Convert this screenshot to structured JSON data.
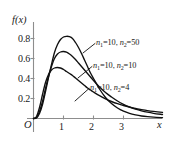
{
  "chart_data": {
    "type": "line",
    "title": "",
    "xlabel": "x",
    "ylabel": "f(x)",
    "xlim": [
      0,
      4.3
    ],
    "ylim": [
      0,
      0.92
    ],
    "xticks": [
      "1",
      "2",
      "3"
    ],
    "xtick_values": [
      1,
      2,
      3
    ],
    "yticks": [
      "0.2",
      "0.4",
      "0.6",
      "0.8"
    ],
    "ytick_values": [
      0.2,
      0.4,
      0.6,
      0.8
    ],
    "origin_label": "O",
    "grid": false,
    "legend_position": "inline-annotations",
    "series": [
      {
        "name": "n1=10, n2=50",
        "label_text": "=10,",
        "n1_symbol": "n",
        "n1_sub": "1",
        "n1_value": "10",
        "n2_symbol": "n",
        "n2_sub": "2",
        "n2_value": "50",
        "peak_x": 1.18,
        "peak_y": 0.82,
        "points_x": [
          0,
          0.1,
          0.2,
          0.3,
          0.4,
          0.5,
          0.6,
          0.7,
          0.8,
          0.9,
          1.0,
          1.1,
          1.2,
          1.3,
          1.4,
          1.5,
          1.6,
          1.7,
          1.8,
          1.9,
          2.0,
          2.2,
          2.4,
          2.6,
          2.8,
          3.0,
          3.2,
          3.4,
          3.6,
          3.8,
          4.0,
          4.3
        ],
        "points_y": [
          0,
          0.006,
          0.05,
          0.14,
          0.27,
          0.41,
          0.54,
          0.66,
          0.74,
          0.79,
          0.815,
          0.822,
          0.818,
          0.8,
          0.76,
          0.71,
          0.65,
          0.585,
          0.52,
          0.455,
          0.4,
          0.295,
          0.21,
          0.15,
          0.105,
          0.073,
          0.051,
          0.036,
          0.025,
          0.018,
          0.013,
          0.008
        ]
      },
      {
        "name": "n1=10, n2=10",
        "label_text": "=10,",
        "n1_symbol": "n",
        "n1_sub": "1",
        "n1_value": "10",
        "n2_symbol": "n",
        "n2_sub": "2",
        "n2_value": "10",
        "peak_x": 1.05,
        "peak_y": 0.67,
        "points_x": [
          0,
          0.1,
          0.2,
          0.3,
          0.4,
          0.5,
          0.6,
          0.7,
          0.8,
          0.9,
          1.0,
          1.1,
          1.2,
          1.3,
          1.4,
          1.5,
          1.6,
          1.7,
          1.8,
          1.9,
          2.0,
          2.2,
          2.4,
          2.6,
          2.8,
          3.0,
          3.2,
          3.4,
          3.6,
          3.8,
          4.0,
          4.3
        ],
        "points_y": [
          0,
          0.01,
          0.07,
          0.17,
          0.3,
          0.42,
          0.52,
          0.6,
          0.645,
          0.665,
          0.67,
          0.663,
          0.645,
          0.62,
          0.59,
          0.555,
          0.52,
          0.485,
          0.45,
          0.415,
          0.38,
          0.315,
          0.26,
          0.215,
          0.175,
          0.142,
          0.115,
          0.094,
          0.077,
          0.063,
          0.052,
          0.04
        ]
      },
      {
        "name": "n1=10, n2=4",
        "label_text": "=10,",
        "n1_symbol": "n",
        "n1_sub": "1",
        "n1_value": "10",
        "n2_symbol": "n",
        "n2_sub": "2",
        "n2_value": "4",
        "peak_x": 0.82,
        "peak_y": 0.51,
        "points_x": [
          0,
          0.1,
          0.2,
          0.3,
          0.4,
          0.5,
          0.6,
          0.7,
          0.8,
          0.9,
          1.0,
          1.1,
          1.2,
          1.3,
          1.4,
          1.5,
          1.6,
          1.7,
          1.8,
          1.9,
          2.0,
          2.2,
          2.4,
          2.6,
          2.8,
          3.0,
          3.2,
          3.4,
          3.6,
          3.8,
          4.0,
          4.3
        ],
        "points_y": [
          0,
          0.02,
          0.11,
          0.24,
          0.36,
          0.44,
          0.485,
          0.505,
          0.51,
          0.505,
          0.49,
          0.47,
          0.45,
          0.43,
          0.405,
          0.38,
          0.355,
          0.33,
          0.305,
          0.285,
          0.265,
          0.228,
          0.196,
          0.17,
          0.148,
          0.13,
          0.114,
          0.1,
          0.089,
          0.079,
          0.071,
          0.061
        ]
      }
    ],
    "colors": {
      "curve": "#101010",
      "axis": "#8d8d8d",
      "text": "#1a1a1a",
      "background": "#ffffff"
    }
  }
}
